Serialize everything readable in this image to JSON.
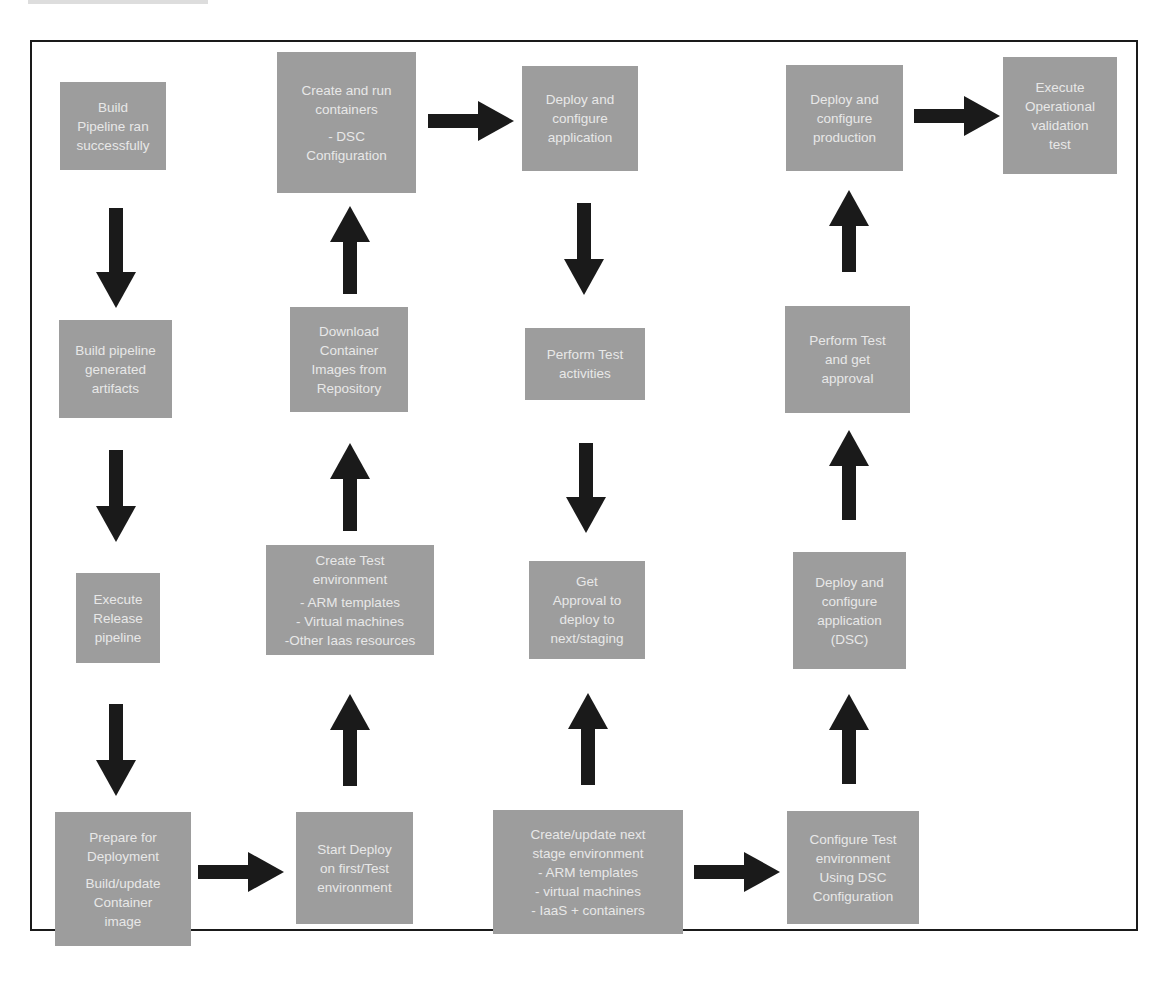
{
  "diagram": {
    "colors": {
      "box_fill": "#9d9d9d",
      "box_text": "#e8e8e8",
      "arrow": "#1a1a1a",
      "frame": "#1a1a1a"
    },
    "nodes": [
      {
        "id": "n1",
        "lines": [
          "Build",
          "Pipeline ran",
          "successfully"
        ]
      },
      {
        "id": "n2",
        "lines": [
          "Build pipeline",
          "generated",
          "artifacts"
        ]
      },
      {
        "id": "n3",
        "lines": [
          "Execute",
          "Release",
          "pipeline"
        ]
      },
      {
        "id": "n4",
        "lines": [
          "Prepare for",
          "Deployment"
        ],
        "lines2": [
          "Build/update",
          "Container",
          "image"
        ]
      },
      {
        "id": "n5",
        "lines": [
          "Start Deploy",
          "on first/Test",
          "environment"
        ]
      },
      {
        "id": "n6",
        "lines": [
          "Create Test",
          "environment"
        ],
        "lines2": [
          "- ARM templates",
          "- Virtual machines",
          "-Other Iaas resources"
        ]
      },
      {
        "id": "n7",
        "lines": [
          "Download",
          "Container",
          "Images from",
          "Repository"
        ]
      },
      {
        "id": "n8",
        "lines": [
          "Create and run",
          "containers"
        ],
        "lines2": [
          "- DSC",
          "Configuration"
        ]
      },
      {
        "id": "n9",
        "lines": [
          "Deploy and",
          "configure",
          "application"
        ]
      },
      {
        "id": "n10",
        "lines": [
          "Perform Test",
          "activities"
        ]
      },
      {
        "id": "n11",
        "lines": [
          "Get",
          "Approval to",
          "deploy to",
          "next/staging"
        ]
      },
      {
        "id": "n12",
        "lines": [
          "Create/update next",
          "stage environment",
          "- ARM templates",
          "- virtual machines",
          "- IaaS + containers"
        ]
      },
      {
        "id": "n13",
        "lines": [
          "Configure Test",
          "environment",
          "Using DSC",
          "Configuration"
        ]
      },
      {
        "id": "n14",
        "lines": [
          "Deploy and",
          "configure",
          "application",
          "(DSC)"
        ]
      },
      {
        "id": "n15",
        "lines": [
          "Perform Test",
          "and get",
          "approval"
        ]
      },
      {
        "id": "n16",
        "lines": [
          "Deploy and",
          "configure",
          "production"
        ]
      },
      {
        "id": "n17",
        "lines": [
          "Execute",
          "Operational",
          "validation",
          "test"
        ]
      }
    ],
    "edges": [
      {
        "from": "n1",
        "to": "n2",
        "direction": "down"
      },
      {
        "from": "n2",
        "to": "n3",
        "direction": "down"
      },
      {
        "from": "n3",
        "to": "n4",
        "direction": "down"
      },
      {
        "from": "n4",
        "to": "n5",
        "direction": "right"
      },
      {
        "from": "n5",
        "to": "n6",
        "direction": "up"
      },
      {
        "from": "n6",
        "to": "n7",
        "direction": "up"
      },
      {
        "from": "n7",
        "to": "n8",
        "direction": "up"
      },
      {
        "from": "n8",
        "to": "n9",
        "direction": "right"
      },
      {
        "from": "n9",
        "to": "n10",
        "direction": "down"
      },
      {
        "from": "n10",
        "to": "n11",
        "direction": "down"
      },
      {
        "from": "n12",
        "to": "n11",
        "direction": "up"
      },
      {
        "from": "n12",
        "to": "n13",
        "direction": "right"
      },
      {
        "from": "n13",
        "to": "n14",
        "direction": "up"
      },
      {
        "from": "n14",
        "to": "n15",
        "direction": "up"
      },
      {
        "from": "n15",
        "to": "n16",
        "direction": "up"
      },
      {
        "from": "n16",
        "to": "n17",
        "direction": "right"
      }
    ]
  }
}
